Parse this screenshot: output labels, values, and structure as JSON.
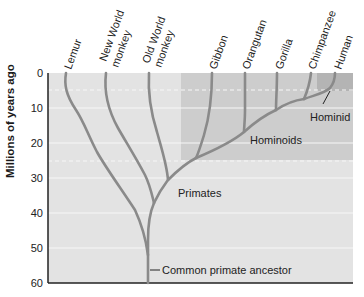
{
  "diagram": {
    "type": "phylogenetic-tree",
    "y_axis": {
      "label": "Millions of years ago",
      "ticks": [
        "0",
        "10",
        "20",
        "30",
        "40",
        "50",
        "60"
      ],
      "range": [
        0,
        60
      ]
    },
    "taxa": [
      {
        "label": "Lemur"
      },
      {
        "label": "New World monkey",
        "line1": "New World",
        "line2": "monkey"
      },
      {
        "label": "Old World monkey",
        "line1": "Old World",
        "line2": "monkey"
      },
      {
        "label": "Gibbon"
      },
      {
        "label": "Orangutan"
      },
      {
        "label": "Gorilla"
      },
      {
        "label": "Chimpanzee"
      },
      {
        "label": "Human"
      }
    ],
    "groups": {
      "primates": "Primates",
      "hominoids": "Hominoids",
      "hominid": "Hominid"
    },
    "annotations": {
      "ancestor": "Common primate ancestor"
    },
    "colors": {
      "background": "#e3e3e3",
      "hominoid_shade": "#cdcdcd",
      "hominid_shade": "#b4b4b4",
      "branch": "#8a8a8a",
      "axis": "#222222",
      "gridline": "#f7f7f7"
    }
  }
}
